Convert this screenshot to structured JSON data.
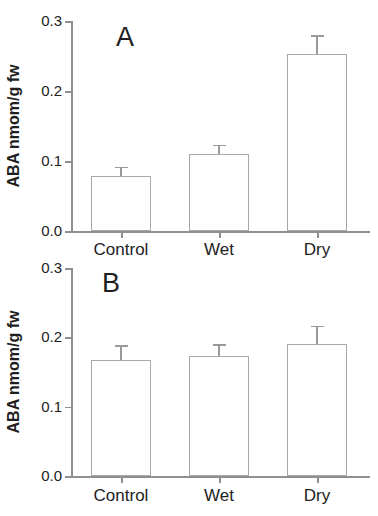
{
  "figure": {
    "background": "#ffffff",
    "colors": {
      "axis": "#8f8f8f",
      "bar_stroke": "#a8a8a8",
      "bar_fill": "#ffffff",
      "error_bar": "#9a9a9a",
      "text": "#222222"
    }
  },
  "chart_data": [
    {
      "type": "bar",
      "panel_label": "A",
      "title": "",
      "xlabel": "",
      "ylabel": "ABA nmom/g fw",
      "categories": [
        "Control",
        "Wet",
        "Dry"
      ],
      "values": [
        0.079,
        0.11,
        0.253
      ],
      "errors": [
        0.013,
        0.013,
        0.027
      ],
      "ylim": [
        0.0,
        0.3
      ],
      "yticks": [
        0.0,
        0.1,
        0.2,
        0.3
      ],
      "ytick_labels": [
        "0.0",
        "0.1",
        "0.2",
        "0.3"
      ],
      "grid": false,
      "legend": null
    },
    {
      "type": "bar",
      "panel_label": "B",
      "title": "",
      "xlabel": "",
      "ylabel": "ABA nmom/g fw",
      "categories": [
        "Control",
        "Wet",
        "Dry"
      ],
      "values": [
        0.168,
        0.173,
        0.19
      ],
      "errors": [
        0.021,
        0.017,
        0.027
      ],
      "ylim": [
        0.0,
        0.3
      ],
      "yticks": [
        0.0,
        0.1,
        0.2,
        0.3
      ],
      "ytick_labels": [
        "0.0",
        "0.1",
        "0.2",
        "0.3"
      ],
      "grid": false,
      "legend": null
    }
  ]
}
